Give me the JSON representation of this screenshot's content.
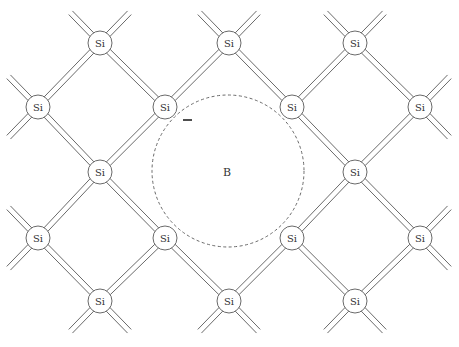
{
  "diagram": {
    "atom_label": "Si",
    "impurity_label": "B",
    "charge_label": "−",
    "colors": {
      "stroke": "#6a6a6a",
      "text": "#333333",
      "background": "#ffffff"
    },
    "atoms": [
      {
        "x": 100,
        "y": 43,
        "label": "Si"
      },
      {
        "x": 229,
        "y": 43,
        "label": "Si"
      },
      {
        "x": 355,
        "y": 43,
        "label": "Si"
      },
      {
        "x": 38,
        "y": 107,
        "label": "Si"
      },
      {
        "x": 165,
        "y": 107,
        "label": "Si"
      },
      {
        "x": 292,
        "y": 107,
        "label": "Si"
      },
      {
        "x": 420,
        "y": 107,
        "label": "Si"
      },
      {
        "x": 100,
        "y": 172,
        "label": "Si"
      },
      {
        "x": 355,
        "y": 172,
        "label": "Si"
      },
      {
        "x": 38,
        "y": 238,
        "label": "Si"
      },
      {
        "x": 165,
        "y": 238,
        "label": "Si"
      },
      {
        "x": 292,
        "y": 238,
        "label": "Si"
      },
      {
        "x": 420,
        "y": 238,
        "label": "Si"
      },
      {
        "x": 100,
        "y": 301,
        "label": "Si"
      },
      {
        "x": 229,
        "y": 301,
        "label": "Si"
      },
      {
        "x": 355,
        "y": 301,
        "label": "Si"
      }
    ],
    "impurity": {
      "x": 228,
      "y": 171,
      "radius": 76,
      "label": "B"
    },
    "charge": {
      "x1": 183,
      "x2": 192,
      "y": 120
    }
  }
}
